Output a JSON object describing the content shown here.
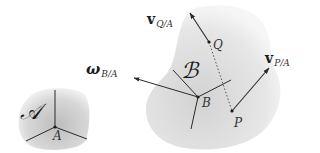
{
  "diagram": {
    "type": "rigid-body-kinematics",
    "colors": {
      "body_fill_center": "#c8c8c8",
      "body_fill_edge": "#f4f4f4",
      "line": "#2a2a2a",
      "text": "#1a1a1a"
    },
    "body_A": {
      "name_label": "𝒜",
      "point_label": "A"
    },
    "body_B": {
      "name_label": "ℬ",
      "point_label": "B"
    },
    "points": {
      "Q": "Q",
      "P": "P"
    },
    "vectors": {
      "v_Q": {
        "symbol": "v",
        "subscript": "Q/A"
      },
      "v_P": {
        "symbol": "v",
        "subscript": "P/A"
      },
      "omega": {
        "symbol": "ω",
        "subscript": "B/A"
      }
    },
    "connections": [
      {
        "from": "Q",
        "to": "P",
        "style": "dotted"
      }
    ]
  }
}
